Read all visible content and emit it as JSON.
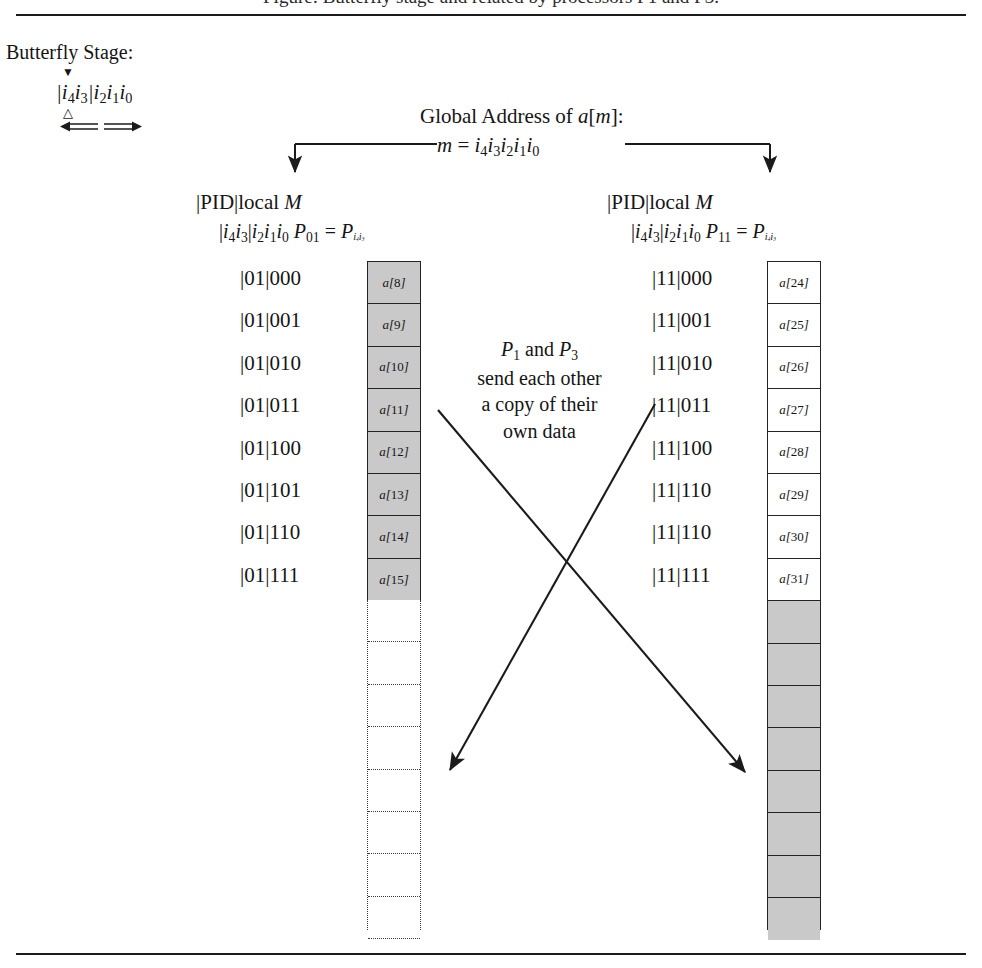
{
  "figure": {
    "caption_fragment": "Figure: Butterfly stage and related by processors P1 and P3.",
    "stage_label": "Butterfly Stage:",
    "butterfly_bits": "|i4i3|i2i1i0",
    "marker_down_icon": "filled-down-triangle-icon",
    "marker_up_icon": "hollow-up-triangle-icon",
    "double_arrow_icon": "left-right-double-arrow-icon"
  },
  "global_address": {
    "title": "Global Address of a[m]:",
    "equation": "m = i4i3i2i1i0",
    "left_branch_icon": "down-arrow-icon",
    "right_branch_icon": "down-arrow-icon"
  },
  "columns": [
    {
      "id": "left",
      "header_pid": "|PID|local M",
      "header_bits": "|i4i3|i2i1i0",
      "processor_label": "P01 = Pi4i3",
      "processor_sub": "01",
      "processor_name": "P",
      "addresses": [
        "|01|000",
        "|01|001",
        "|01|010",
        "|01|011",
        "|01|100",
        "|01|101",
        "|01|110",
        "|01|111"
      ],
      "cells": [
        "a[8]",
        "a[9]",
        "a[10]",
        "a[11]",
        "a[12]",
        "a[13]",
        "a[14]",
        "a[15]"
      ],
      "cell_fill": "shaded",
      "trailing_style": "dotted-empty",
      "trailing_cells": 8
    },
    {
      "id": "right",
      "header_pid": "|PID|local M",
      "header_bits": "|i4i3|i2i1i0",
      "processor_label": "P11 = Pi4i3",
      "processor_sub": "11",
      "processor_name": "P",
      "addresses": [
        "|11|000",
        "|11|001",
        "|11|010",
        "|11|011",
        "|11|100",
        "|11|110",
        "|11|110",
        "|11|111"
      ],
      "cells": [
        "a[24]",
        "a[25]",
        "a[26]",
        "a[27]",
        "a[28]",
        "a[29]",
        "a[30]",
        "a[31]"
      ],
      "cell_fill": "white",
      "trailing_style": "shaded-empty",
      "trailing_cells": 8
    }
  ],
  "center_note": {
    "line1_prefix": "P",
    "line1_sub1": "1",
    "line1_mid": " and ",
    "line1_sub2": "3",
    "line1": "P1 and P3",
    "line2": "send each other",
    "line3": "a copy of their",
    "line4": "own data"
  },
  "arrows": {
    "left_to_right_icon": "diagonal-arrow-icon",
    "right_to_left_icon": "diagonal-arrow-icon"
  },
  "colors": {
    "shade": "#c9c9c9",
    "ink": "#1b1b1b",
    "paper": "#ffffff"
  }
}
